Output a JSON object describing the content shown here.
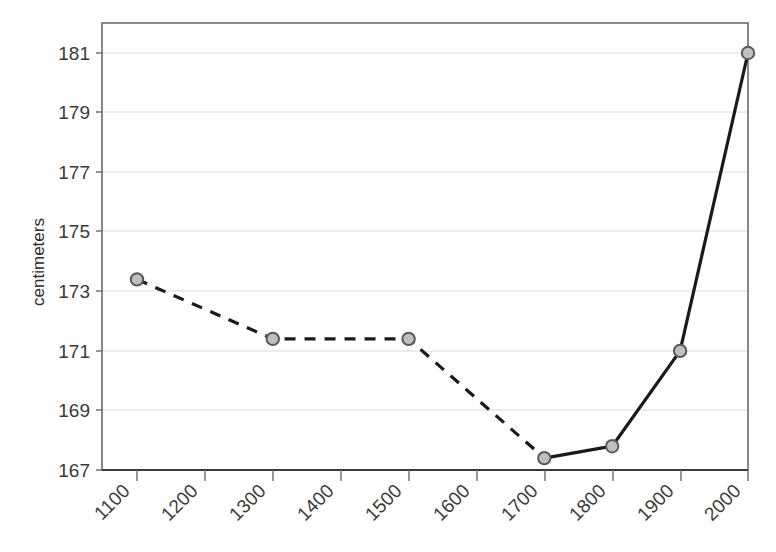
{
  "chart_data": {
    "type": "line",
    "title": "",
    "subtitle": "",
    "xlabel": "",
    "ylabel": "centimeters",
    "x": [
      1100,
      1300,
      1500,
      1700,
      1800,
      1900,
      2000
    ],
    "values": [
      173.4,
      171.4,
      171.4,
      167.4,
      167.8,
      171.0,
      181.0
    ],
    "series": [
      {
        "name": "centimeters",
        "x": [
          1100,
          1300,
          1500,
          1700,
          1800,
          1900,
          2000
        ],
        "values": [
          173.4,
          171.4,
          171.4,
          167.4,
          167.8,
          171.0,
          181.0
        ],
        "line_style_segments": [
          {
            "from": 1100,
            "to": 1700,
            "style": "dashed"
          },
          {
            "from": 1700,
            "to": 2000,
            "style": "solid"
          }
        ],
        "marker": "circle",
        "marker_fill": "#bfbfbf",
        "marker_edge": "#595959",
        "line_color": "#1a1a1a"
      }
    ],
    "xlim": [
      1050,
      2050
    ],
    "ylim": [
      167,
      182
    ],
    "xticks": [
      1100,
      1200,
      1300,
      1400,
      1500,
      1600,
      1700,
      1800,
      1900,
      2000
    ],
    "xtick_labels": [
      "1100",
      "1200",
      "1300",
      "1400",
      "1500",
      "1600",
      "1700",
      "1800",
      "1900",
      "2000"
    ],
    "yticks": [
      167,
      169,
      171,
      173,
      175,
      177,
      179,
      181
    ],
    "ytick_labels": [
      "167",
      "169",
      "171",
      "173",
      "175",
      "177",
      "179",
      "181"
    ],
    "grid": {
      "horizontal": true,
      "vertical": false,
      "color": "#d9d9d9"
    },
    "legend": {
      "visible": false,
      "position": "none"
    },
    "xtick_label_rotation": -45,
    "plot_border": {
      "top": true,
      "right": true,
      "bottom": true,
      "left": true,
      "color": "#595959"
    }
  },
  "axes": {
    "y_title": "centimeters"
  },
  "ticks": {
    "y": [
      {
        "label": "181"
      },
      {
        "label": "179"
      },
      {
        "label": "177"
      },
      {
        "label": "175"
      },
      {
        "label": "173"
      },
      {
        "label": "171"
      },
      {
        "label": "169"
      },
      {
        "label": "167"
      }
    ],
    "x": [
      {
        "label": "1100"
      },
      {
        "label": "1200"
      },
      {
        "label": "1300"
      },
      {
        "label": "1400"
      },
      {
        "label": "1500"
      },
      {
        "label": "1600"
      },
      {
        "label": "1700"
      },
      {
        "label": "1800"
      },
      {
        "label": "1900"
      },
      {
        "label": "2000"
      }
    ]
  }
}
